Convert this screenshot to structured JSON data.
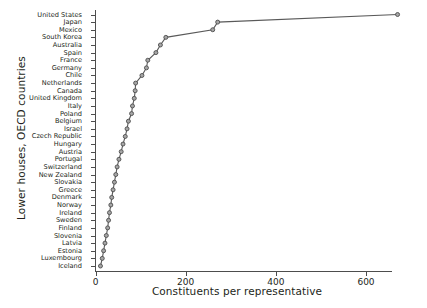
{
  "chart_data": {
    "type": "line",
    "title": "",
    "xlabel": "Constituents per representative",
    "ylabel": "Lower houses, OECD countries",
    "xlim": [
      0,
      720
    ],
    "ylim_categories": 36,
    "xticks": [
      0,
      200,
      400,
      600
    ],
    "xticklabels": [
      "0",
      "200",
      "400",
      "600"
    ],
    "grid": false,
    "legend": false,
    "orientation": "horizontal-categories",
    "note": "Values are thousands of constituents per representative; read off x-axis.",
    "categories": [
      "United States",
      "Japan",
      "Mexico",
      "South Korea",
      "Australia",
      "Spain",
      "France",
      "Germany",
      "Chile",
      "Netherlands",
      "Canada",
      "United Kingdom",
      "Italy",
      "Poland",
      "Belgium",
      "Israel",
      "Czech Republic",
      "Hungary",
      "Austria",
      "Portugal",
      "Switzerland",
      "New Zealand",
      "Slovakia",
      "Greece",
      "Denmark",
      "Norway",
      "Ireland",
      "Sweden",
      "Finland",
      "Slovenia",
      "Latvia",
      "Estonia",
      "Luxembourg",
      "Iceland"
    ],
    "values": [
      670,
      271,
      260,
      156,
      144,
      134,
      116,
      113,
      103,
      89,
      88,
      86,
      82,
      80,
      73,
      70,
      66,
      61,
      57,
      52,
      48,
      45,
      42,
      39,
      36,
      34,
      31,
      29,
      27,
      24,
      21,
      18,
      15,
      11
    ],
    "marker": "circle",
    "marker_face_color": "#a6a6a6",
    "marker_edge_color": "#4d4d4d",
    "line_color": "#595959"
  }
}
